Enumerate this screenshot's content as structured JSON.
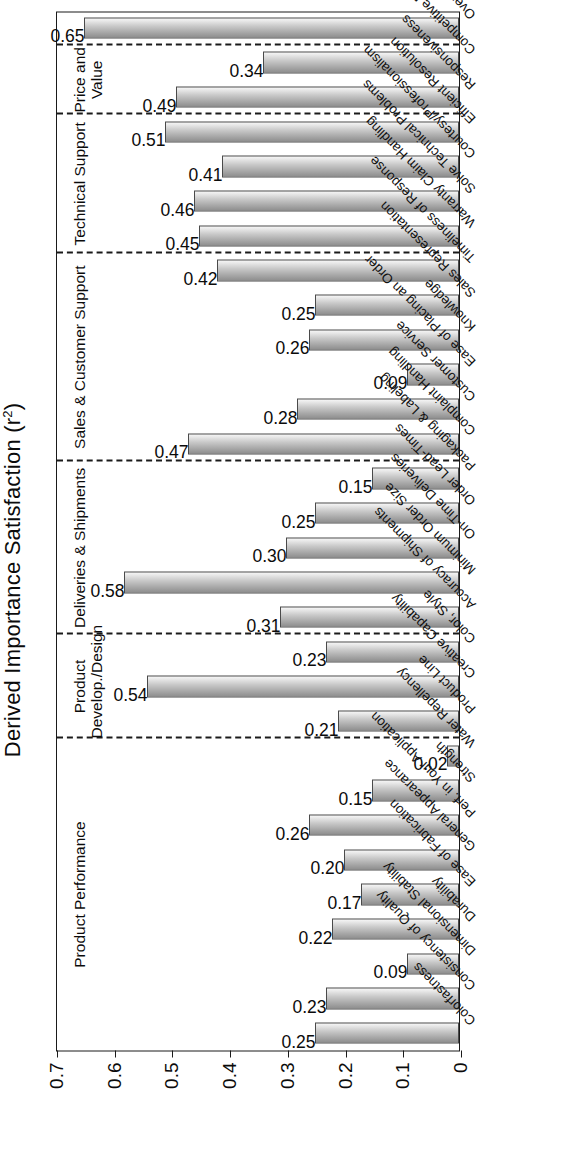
{
  "chart_data": {
    "type": "bar",
    "orientation": "vertical-rotated",
    "title": "",
    "ylabel": "Derived Importance Satisfaction (r²)",
    "xlabel": "",
    "ylim": [
      0,
      0.7
    ],
    "ytick_labels": [
      "0",
      "0.1",
      "0.2",
      "0.3",
      "0.4",
      "0.5",
      "0.6",
      "0.7"
    ],
    "ytick_values": [
      0,
      0.1,
      0.2,
      0.3,
      0.4,
      0.5,
      0.6,
      0.7
    ],
    "grid": false,
    "legend": "none",
    "bar_color": "#b5b5b5",
    "categories": [
      "Colorfastness",
      "Consistency of Quality",
      "Dimensional Stability",
      "Durability",
      "Ease of Fabrication",
      "General Appearance",
      "Perf. in Your Application",
      "Strength",
      "Water Repellency",
      "Product Line",
      "Creative Capability",
      "Color, Style",
      "Accuracy of Shipments",
      "Minimum Order Size",
      "On-Time Deliveries",
      "Order Lead-Times",
      "Packaging & Labeling",
      "Complaint Handling",
      "Customer Service",
      "Ease of Placing an Order",
      "Knowledge",
      "Sales Representation",
      "Timeliness of Response",
      "Warranty Claim Handling",
      "Solve Technical Problems",
      "Courtesy/Professionalism",
      "Efficient Resolution",
      "Responsiveness",
      "Competitive Price",
      "Overall Value"
    ],
    "values": [
      0.25,
      0.23,
      0.09,
      0.22,
      0.17,
      0.2,
      0.26,
      0.15,
      0.02,
      0.21,
      0.54,
      0.23,
      0.31,
      0.58,
      0.3,
      0.25,
      0.15,
      0.47,
      0.28,
      0.09,
      0.26,
      0.25,
      0.42,
      0.45,
      0.46,
      0.41,
      0.51,
      0.49,
      0.34,
      0.65
    ],
    "value_labels": [
      "0.25",
      "0.23",
      "0.09",
      "0.22",
      "0.17",
      "0.20",
      "0.26",
      "0.15",
      "0.02",
      "0.21",
      "0.54",
      "0.23",
      "0.31",
      "0.58",
      "0.30",
      "0.25",
      "0.15",
      "0.47",
      "0.28",
      "0.09",
      "0.26",
      "0.25",
      "0.42",
      "0.45",
      "0.46",
      "0.41",
      "0.51",
      "0.49",
      "0.34",
      "0.65"
    ],
    "groups": [
      {
        "name": "Product Performance",
        "start": 0,
        "count": 9
      },
      {
        "name": "Product\nDevelop./Design",
        "start": 9,
        "count": 3
      },
      {
        "name": "Deliveries  &  Shipments",
        "start": 12,
        "count": 5
      },
      {
        "name": "Sales  &  Customer Support",
        "start": 17,
        "count": 6
      },
      {
        "name": "Technical  Support",
        "start": 23,
        "count": 4
      },
      {
        "name": "Price and\nValue",
        "start": 27,
        "count": 2
      },
      {
        "name": "",
        "start": 29,
        "count": 1
      }
    ]
  },
  "axis": {
    "y_title": "Derived Importance Satisfaction (r²)"
  }
}
